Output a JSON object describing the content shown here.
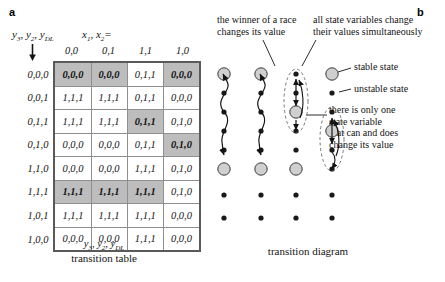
{
  "figure": {
    "panel_a_letter": "a",
    "panel_b_letter": "b"
  },
  "panel_a": {
    "row_variables_label": "y3, y2, yDL",
    "col_variables_label": "x1, x2=",
    "column_headers": [
      "0,0",
      "0,1",
      "1,1",
      "1,0"
    ],
    "row_headers": [
      "0,0,0",
      "0,0,1",
      "0,1,1",
      "0,1,0",
      "1,1,0",
      "1,1,1",
      "1,0,1",
      "1,0,0"
    ],
    "footer_variables": "y3, y2, yDL",
    "caption": "transition table",
    "cells": [
      [
        "0,0,0",
        "0,0,0",
        "0,1,1",
        "0,0,0"
      ],
      [
        "1,1,1",
        "1,1,1",
        "0,1,1",
        "0,0,0"
      ],
      [
        "1,1,1",
        "1,1,1",
        "0,1,1",
        "0,1,0"
      ],
      [
        "0,0,0",
        "0,0,0",
        "0,1,1",
        "0,1,0"
      ],
      [
        "0,0,0",
        "0,0,0",
        "1,1,1",
        "0,1,0"
      ],
      [
        "1,1,1",
        "1,1,1",
        "1,1,1",
        "0,1,0"
      ],
      [
        "1,1,1",
        "1,1,1",
        "1,1,1",
        "0,0,0"
      ],
      [
        "0,0,0",
        "0,0,0",
        "1,1,1",
        "0,0,0"
      ]
    ],
    "stable_cells": [
      [
        0,
        0
      ],
      [
        0,
        1
      ],
      [
        0,
        3
      ],
      [
        2,
        2
      ],
      [
        3,
        3
      ],
      [
        5,
        0
      ],
      [
        5,
        1
      ],
      [
        5,
        2
      ]
    ]
  },
  "panel_b": {
    "annotation_race": "the winner of a race\nchanges its value",
    "annotation_simultaneous": "all state variables change\ntheir values simultaneously",
    "label_stable_state": "stable state",
    "label_unstable_state": "unstable state",
    "annotation_only_one": "there is only one\nstate variable\nthat can and does\nchange its value",
    "caption": "transition diagram",
    "columns": 4,
    "rows": 8,
    "stable_nodes": [
      [
        0,
        0
      ],
      [
        1,
        0
      ],
      [
        3,
        0
      ],
      [
        2,
        2
      ],
      [
        3,
        3
      ],
      [
        0,
        5
      ],
      [
        1,
        5
      ],
      [
        2,
        5
      ]
    ]
  },
  "colors": {
    "shaded_cell": "#bdbdbd",
    "stable_node_fill": "#cfcfcf",
    "unstable_node_fill": "#1a1a1a",
    "grid_line": "#8f8f8f",
    "outline": "#5a5a5a",
    "text": "#141414"
  }
}
